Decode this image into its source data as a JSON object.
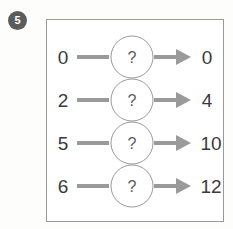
{
  "question": {
    "number": "5",
    "badge_color": "#5c5c5c"
  },
  "panel": {
    "border_color": "#9a9a9a",
    "background_color": "#ffffff"
  },
  "style": {
    "connector_color": "#9a9a9a",
    "arrow_color": "#9a9a9a",
    "circle_stroke_color": "#9a9a9a",
    "number_color": "#3a3a3a",
    "question_mark_color": "#5a5a5a"
  },
  "machine": {
    "operator_label": "?",
    "rows": [
      {
        "input": "0",
        "operator": "?",
        "output": "0"
      },
      {
        "input": "2",
        "operator": "?",
        "output": "4"
      },
      {
        "input": "5",
        "operator": "?",
        "output": "10"
      },
      {
        "input": "6",
        "operator": "?",
        "output": "12"
      }
    ]
  }
}
